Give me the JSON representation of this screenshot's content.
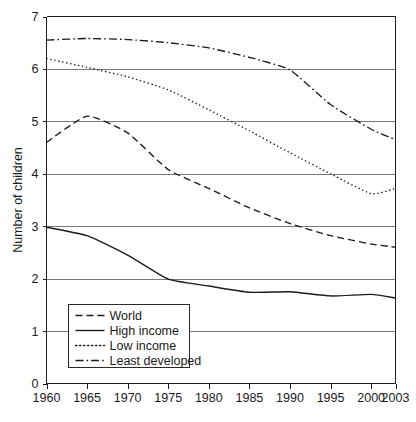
{
  "chart_data": {
    "type": "line",
    "title": "",
    "xlabel": "",
    "ylabel": "Number of children",
    "x": [
      1960,
      1965,
      1970,
      1975,
      1980,
      1985,
      1990,
      1995,
      2000,
      2003
    ],
    "xlim": [
      1960,
      2003
    ],
    "ylim": [
      0,
      7
    ],
    "yticks": [
      0,
      1,
      2,
      3,
      4,
      5,
      6,
      7
    ],
    "xticks": [
      "1960",
      "1965",
      "1970",
      "1975",
      "1980",
      "1985",
      "1990",
      "1995",
      "2000",
      "2003"
    ],
    "grid": "horizontal",
    "legend_position": "bottom-left",
    "series": [
      {
        "name": "World",
        "dash": "dashed",
        "values": [
          4.6,
          5.1,
          4.78,
          4.08,
          3.72,
          3.35,
          3.05,
          2.82,
          2.66,
          2.6
        ]
      },
      {
        "name": "High income",
        "dash": "solid",
        "values": [
          2.98,
          2.82,
          2.45,
          1.99,
          1.86,
          1.74,
          1.75,
          1.67,
          1.7,
          1.63
        ]
      },
      {
        "name": "Low income",
        "dash": "dotted",
        "values": [
          6.2,
          6.03,
          5.85,
          5.6,
          5.22,
          4.82,
          4.4,
          4.0,
          3.62,
          3.72
        ]
      },
      {
        "name": "Least developed",
        "dash": "dashdot",
        "values": [
          6.55,
          6.58,
          6.56,
          6.5,
          6.4,
          6.22,
          5.98,
          5.32,
          4.85,
          4.65
        ]
      }
    ]
  },
  "axis": {
    "y_title": "Number of children",
    "y_tick_0": "0",
    "y_tick_1": "1",
    "y_tick_2": "2",
    "y_tick_3": "3",
    "y_tick_4": "4",
    "y_tick_5": "5",
    "y_tick_6": "6",
    "y_tick_7": "7",
    "x_tick_0": "1960",
    "x_tick_1": "1965",
    "x_tick_2": "1970",
    "x_tick_3": "1975",
    "x_tick_4": "1980",
    "x_tick_5": "1985",
    "x_tick_6": "1990",
    "x_tick_7": "1995",
    "x_tick_8": "2000",
    "x_tick_9": "2003"
  },
  "legend": {
    "items": [
      {
        "label": "World"
      },
      {
        "label": "High income"
      },
      {
        "label": "Low income"
      },
      {
        "label": "Least developed"
      }
    ]
  },
  "caption": {
    "text": ""
  },
  "colors": {
    "line": "#1b1b1b",
    "grid": "#7a7a7a",
    "axis": "#1f1f1f",
    "background": "#ffffff"
  }
}
